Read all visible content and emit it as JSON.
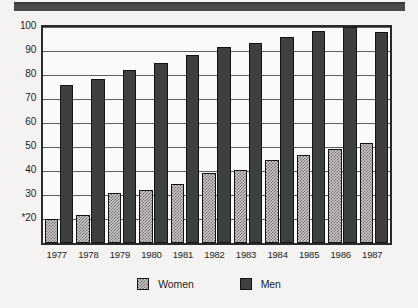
{
  "header": {
    "band_color": "#4a4a4a"
  },
  "chart_data": {
    "type": "bar",
    "title": "",
    "xlabel": "",
    "ylabel": "",
    "categories": [
      "1977",
      "1978",
      "1979",
      "1980",
      "1981",
      "1982",
      "1983",
      "1984",
      "1985",
      "1986",
      "1987"
    ],
    "series": [
      {
        "name": "Women",
        "color": "#cfcccb",
        "values": [
          20,
          21.5,
          31,
          32,
          34.5,
          39,
          40.5,
          44.5,
          46.5,
          49,
          51.5
        ]
      },
      {
        "name": "Men",
        "color": "#3f3f3f",
        "values": [
          76,
          78.5,
          82,
          85,
          88.5,
          91.5,
          93.5,
          96,
          98.5,
          100,
          98
        ]
      }
    ],
    "ylim": [
      10,
      100
    ],
    "yticks": [
      20,
      30,
      40,
      50,
      60,
      70,
      80,
      90,
      100
    ],
    "ytick_labels": [
      "*20",
      "30",
      "40",
      "50",
      "60",
      "70",
      "80",
      "90",
      "100"
    ],
    "gridlines": [
      20,
      30,
      40,
      50,
      60,
      70,
      80,
      90,
      100
    ],
    "grid": true,
    "legend_position": "bottom-center"
  },
  "legend": {
    "items": [
      {
        "label": "Women",
        "swatch": "women-swatch"
      },
      {
        "label": "Men",
        "swatch": "men-swatch"
      }
    ]
  }
}
